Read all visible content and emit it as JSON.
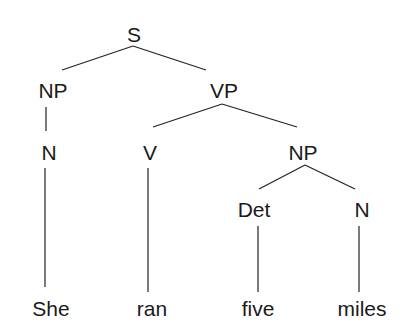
{
  "diagram": {
    "type": "syntax-tree",
    "sentence": "She ran five miles",
    "nodes": [
      {
        "id": "S",
        "label": "S",
        "x": 134,
        "y": 24
      },
      {
        "id": "NP1",
        "label": "NP",
        "x": 53,
        "y": 80
      },
      {
        "id": "VP",
        "label": "VP",
        "x": 224,
        "y": 80
      },
      {
        "id": "N1",
        "label": "N",
        "x": 49,
        "y": 142
      },
      {
        "id": "V",
        "label": "V",
        "x": 150,
        "y": 142
      },
      {
        "id": "NP2",
        "label": "NP",
        "x": 303,
        "y": 142
      },
      {
        "id": "Det",
        "label": "Det",
        "x": 254,
        "y": 199
      },
      {
        "id": "N2",
        "label": "N",
        "x": 362,
        "y": 199
      },
      {
        "id": "She",
        "label": "She",
        "x": 51,
        "y": 298
      },
      {
        "id": "ran",
        "label": "ran",
        "x": 152,
        "y": 298
      },
      {
        "id": "five",
        "label": "five",
        "x": 258,
        "y": 298
      },
      {
        "id": "miles",
        "label": "miles",
        "x": 362,
        "y": 298
      }
    ],
    "edges": [
      {
        "from": "S",
        "to": "NP1",
        "x1": 133,
        "y1": 46,
        "x2": 62,
        "y2": 70
      },
      {
        "from": "S",
        "to": "VP",
        "x1": 133,
        "y1": 46,
        "x2": 206,
        "y2": 70
      },
      {
        "from": "NP1",
        "to": "N1",
        "x1": 46,
        "y1": 107,
        "x2": 46,
        "y2": 131
      },
      {
        "from": "VP",
        "to": "V",
        "x1": 222,
        "y1": 104,
        "x2": 153,
        "y2": 127
      },
      {
        "from": "VP",
        "to": "NP2",
        "x1": 222,
        "y1": 104,
        "x2": 297,
        "y2": 127
      },
      {
        "from": "N1",
        "to": "She",
        "x1": 45,
        "y1": 168,
        "x2": 45,
        "y2": 287
      },
      {
        "from": "V",
        "to": "ran",
        "x1": 148,
        "y1": 168,
        "x2": 148,
        "y2": 292
      },
      {
        "from": "NP2",
        "to": "Det",
        "x1": 305,
        "y1": 165,
        "x2": 259,
        "y2": 189
      },
      {
        "from": "NP2",
        "to": "N2",
        "x1": 305,
        "y1": 165,
        "x2": 355,
        "y2": 189
      },
      {
        "from": "Det",
        "to": "five",
        "x1": 258,
        "y1": 226,
        "x2": 258,
        "y2": 292
      },
      {
        "from": "N2",
        "to": "miles",
        "x1": 359,
        "y1": 226,
        "x2": 359,
        "y2": 292
      }
    ]
  }
}
